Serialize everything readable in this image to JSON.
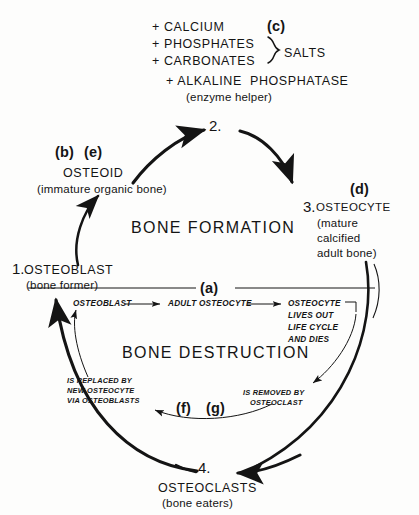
{
  "figure": {
    "background_color": "#fdfdfc",
    "ink_color": "#141414"
  },
  "top_ingredients": {
    "line1": "+ CALCIUM",
    "line2": "+ PHOSPHATES",
    "line3": "+ CARBONATES",
    "brace_label": "SALTS",
    "line4": "+ ALKALINE  PHOSPHATASE",
    "line5": "(enzyme helper)",
    "key_tag": "(c)"
  },
  "outer_cycle": {
    "formation_label": "BONE FORMATION",
    "destruction_label": "BONE DESTRUCTION",
    "nodes": [
      {
        "number": "1.",
        "name": "OSTEOBLAST",
        "sub": "(bone former)",
        "key_tag": ""
      },
      {
        "number": "2.",
        "name": "",
        "sub": "",
        "key_tag": ""
      },
      {
        "number": "3.",
        "name": "OSTEOCYTE",
        "sub_line1": "(mature",
        "sub_line2": "calcified",
        "sub_line3": "adult bone)",
        "key_tag": "(d)"
      },
      {
        "number": "4.",
        "name": "OSTEOCLASTS",
        "sub": "(bone eaters)",
        "key_tag": ""
      }
    ],
    "osteoid": {
      "name": "OSTEOID",
      "sub": "(immature organic bone)",
      "key_tag_b": "(b)",
      "key_tag_e": "(e)"
    }
  },
  "inner_cycle": {
    "key_tag_a": "(a)",
    "key_tag_f": "(f)",
    "key_tag_g": "(g)",
    "step1": "OSTEOBLAST",
    "step2": "ADULT OSTEOCYTE",
    "step3_line1": "OSTEOCYTE",
    "step3_line2": "LIVES OUT",
    "step3_line3": "LIFE CYCLE",
    "step3_line4": "AND DIES",
    "note_left_line1": "IS REPLACED BY",
    "note_left_line2": "NEW OSTEOCYTE",
    "note_left_line3": "VIA OSTEOBLASTS",
    "note_right_line1": "IS REMOVED BY",
    "note_right_line2": "OSTEOCLAST"
  }
}
